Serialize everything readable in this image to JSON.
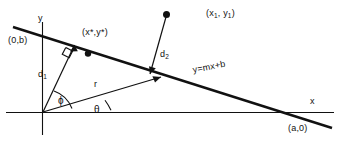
{
  "figure": {
    "stroke_color": "#111111",
    "background_color": "#ffffff",
    "axes": {
      "y_axis_label": "y",
      "x_axis_label": "x",
      "y_intercept_label": "(0,b)",
      "x_intercept_label": "(a,0)"
    },
    "line": {
      "equation_label": "y=mx+b"
    },
    "points": [
      {
        "name": "foot-point",
        "label": "(x*,y*)"
      },
      {
        "name": "external-point",
        "label_prefix": "(x",
        "label_sub1": "1",
        "label_mid": ", y",
        "label_sub2": "1",
        "label_suffix": ")"
      }
    ],
    "segments": [
      {
        "name": "d1",
        "label_prefix": "d",
        "label_sub": "1"
      },
      {
        "name": "d2",
        "label_prefix": "d",
        "label_sub": "2"
      },
      {
        "name": "r",
        "label": "r"
      }
    ],
    "angles": [
      {
        "name": "phi",
        "label": "ϕ"
      },
      {
        "name": "theta",
        "label": "θ"
      }
    ]
  }
}
